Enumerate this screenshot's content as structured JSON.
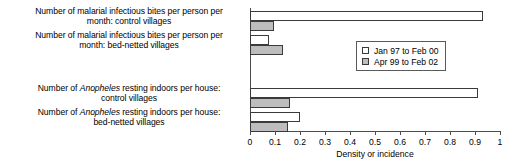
{
  "chart_data": {
    "type": "bar",
    "orientation": "horizontal",
    "title": "",
    "xlabel": "Density or incidence",
    "ylabel": "",
    "xlim": [
      0,
      1
    ],
    "xticks": [
      "0",
      "0.1",
      "0.2",
      "0.3",
      "0.4",
      "0.5",
      "0.6",
      "0.7",
      "0.8",
      "0.9",
      "1"
    ],
    "grid": false,
    "legend_position": "inside-right-upper",
    "categories": [
      "Number of malarial infectious bites per person per month: control villages",
      "Number of malarial infectious bites per person per month: bed-netted villages",
      "Number of Anopheles resting indoors per house: control villages",
      "Number of Anopheles resting indoors per house: bed-netted villages"
    ],
    "series": [
      {
        "name": "Jan 97 to Feb 00",
        "color": "#ffffff",
        "values": [
          0.93,
          0.075,
          0.91,
          0.2
        ]
      },
      {
        "name": "Apr 99 to Feb 02",
        "color": "#bdbdbd",
        "values": [
          0.095,
          0.13,
          0.16,
          0.15
        ]
      }
    ]
  },
  "labels": {
    "cat1_line1": "Number of malarial infectious bites per person per",
    "cat1_line2": "month: control villages",
    "cat2_line1": "Number of malarial infectious bites per person per",
    "cat2_line2": "month: bed-netted villages",
    "cat3_line1_pre": "Number of ",
    "cat3_line1_italic": "Anopheles",
    "cat3_line1_post": " resting indoors per house:",
    "cat3_line2": "control villages",
    "cat4_line1_pre": "Number of ",
    "cat4_line1_italic": "Anopheles",
    "cat4_line1_post": " resting indoors per house:",
    "cat4_line2": "bed-netted villages"
  },
  "axis": {
    "tick0": "0",
    "tick1": "0.1",
    "tick2": "0.2",
    "tick3": "0.3",
    "tick4": "0.4",
    "tick5": "0.5",
    "tick6": "0.6",
    "tick7": "0.7",
    "tick8": "0.8",
    "tick9": "0.9",
    "tick10": "1",
    "title": "Density or incidence"
  },
  "legend": {
    "series_a_label": "Jan 97 to Feb 00",
    "series_b_label": "Apr 99 to Feb 02"
  }
}
